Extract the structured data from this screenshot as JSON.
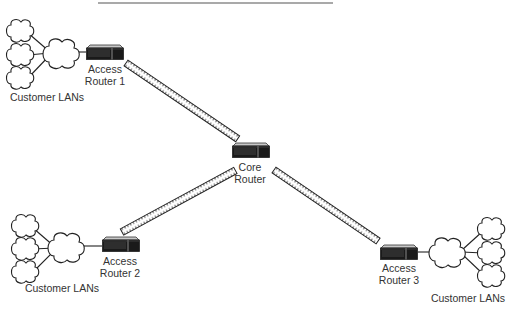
{
  "diagram": {
    "type": "network-topology",
    "header_rule": {
      "x1": 98,
      "x2": 333,
      "y": 3
    },
    "colors": {
      "line": "#222222",
      "router_body": "#1a1a1a",
      "router_top": "#bdbdbd",
      "link_fill": "#ffffff",
      "text": "#333333"
    },
    "nodes": [
      {
        "id": "access-router-1",
        "kind": "router",
        "label_line1": "Access",
        "label_line2": "Router 1",
        "x": 86,
        "y": 45,
        "w": 38,
        "h": 15
      },
      {
        "id": "core-router",
        "kind": "router",
        "label_line1": "Core",
        "label_line2": "Router",
        "x": 232,
        "y": 143,
        "w": 37,
        "h": 15
      },
      {
        "id": "access-router-2",
        "kind": "router",
        "label_line1": "Access",
        "label_line2": "Router 2",
        "x": 102,
        "y": 237,
        "w": 37,
        "h": 15
      },
      {
        "id": "access-router-3",
        "kind": "router",
        "label_line1": "Access",
        "label_line2": "Router 3",
        "x": 380,
        "y": 245,
        "w": 38,
        "h": 15
      }
    ],
    "lan_groups": [
      {
        "id": "lans-1",
        "label": "Customer LANs",
        "attached_to": "access-router-1"
      },
      {
        "id": "lans-2",
        "label": "Customer LANs",
        "attached_to": "access-router-2"
      },
      {
        "id": "lans-3",
        "label": "Customer LANs",
        "attached_to": "access-router-3"
      }
    ],
    "links": [
      {
        "from": "access-router-1",
        "to": "core-router",
        "style": "serial-link"
      },
      {
        "from": "access-router-2",
        "to": "core-router",
        "style": "serial-link"
      },
      {
        "from": "core-router",
        "to": "access-router-3",
        "style": "serial-link"
      }
    ]
  }
}
